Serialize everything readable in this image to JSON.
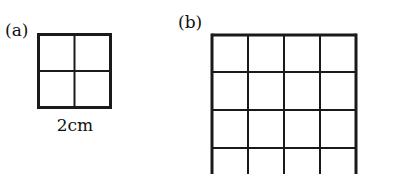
{
  "figures": [
    {
      "id": "a",
      "label": "(a)",
      "caption": "2cm",
      "grid": {
        "rows": 2,
        "cols": 2
      }
    },
    {
      "id": "b",
      "label": "(b)",
      "grid": {
        "rows": 4,
        "cols": 4,
        "cropped_bottom": true
      }
    }
  ],
  "colors": {
    "line": "#1a1a1a",
    "background": "#ffffff"
  }
}
